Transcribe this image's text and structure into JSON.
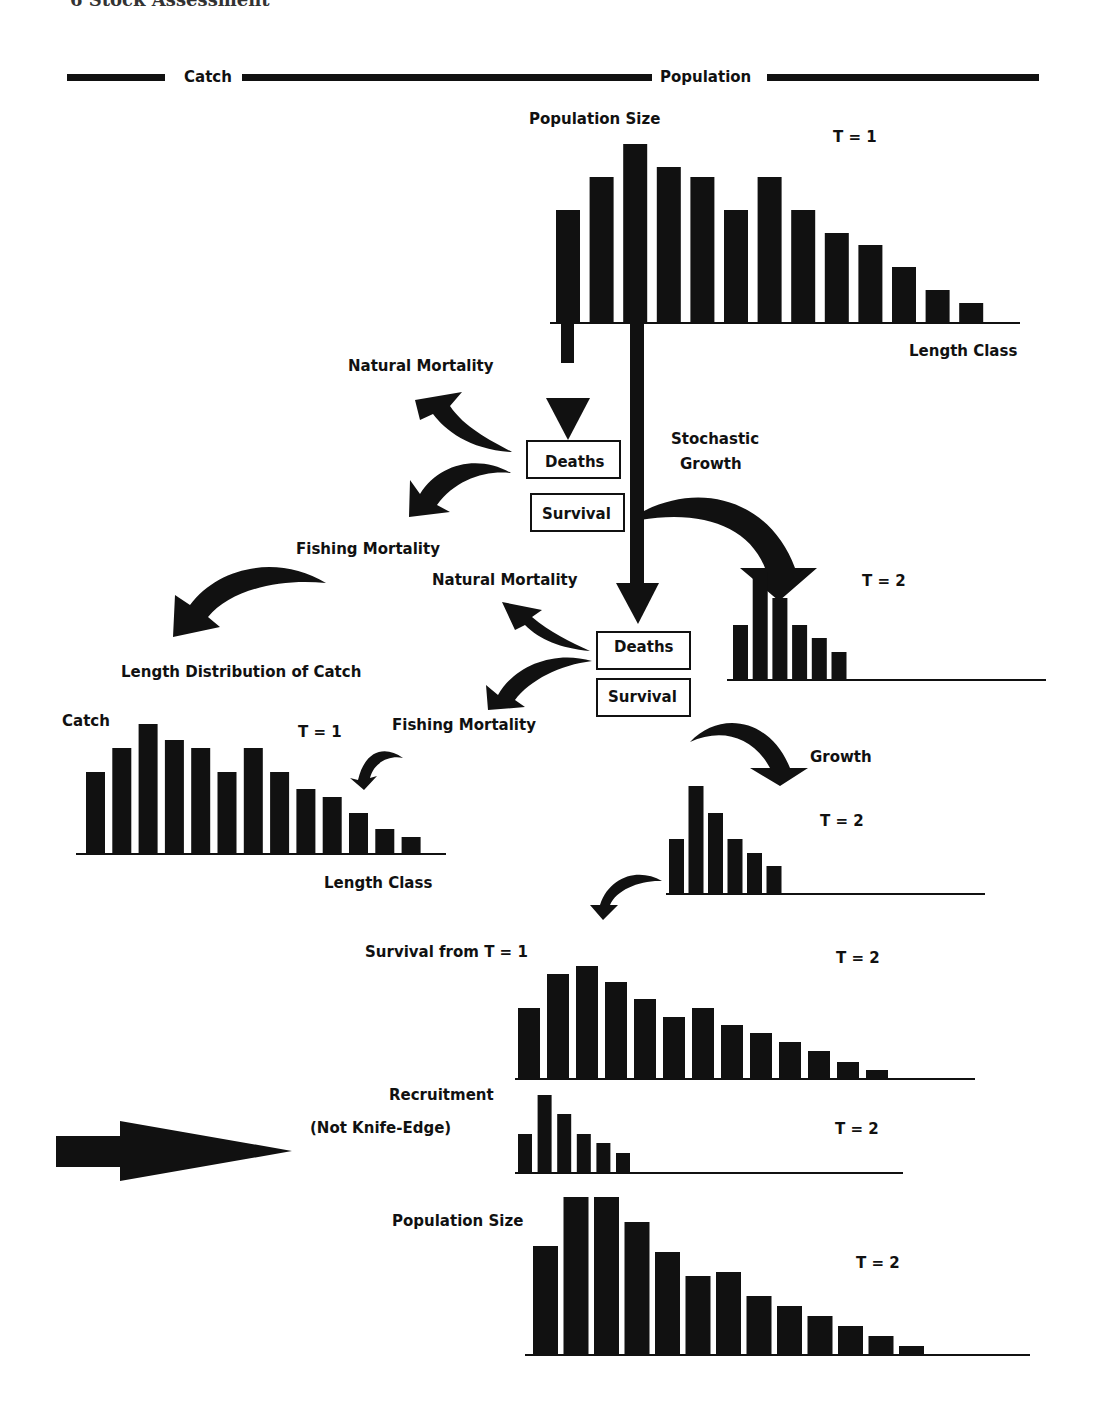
{
  "page": {
    "header_text": "6  Stock Assessment",
    "ink_color": "#111111",
    "background": "#ffffff"
  },
  "section_bar": {
    "catch_label": "Catch",
    "population_label": "Population"
  },
  "labels": {
    "population_size_t1": "Population Size",
    "t1_top": "T = 1",
    "length_class_top": "Length Class",
    "natural_mortality_1": "Natural Mortality",
    "deaths_1": "Deaths",
    "survival_1": "Survival",
    "stochastic_growth_line1": "Stochastic",
    "stochastic_growth_line2": "Growth",
    "fishing_mortality_1": "Fishing Mortality",
    "natural_mortality_2": "Natural Mortality",
    "t2_growth1": "T = 2",
    "deaths_2": "Deaths",
    "survival_2": "Survival",
    "length_distribution_catch": "Length Distribution of Catch",
    "catch": "Catch",
    "t1_catch": "T = 1",
    "fishing_mortality_2": "Fishing Mortality",
    "length_class_catch": "Length Class",
    "growth": "Growth",
    "t2_growth2": "T = 2",
    "survival_from_t1": "Survival from T = 1",
    "t2_survival": "T = 2",
    "recruitment_line1": "Recruitment",
    "recruitment_line2": "(Not Knife-Edge)",
    "t2_recruitment": "T = 2",
    "population_size_t2": "Population Size",
    "t2_population": "T = 2"
  },
  "icons": {
    "down-arrow": "straight-down-arrow",
    "curved-arrow": "curved-arrow",
    "right-arrow": "large-right-arrow"
  },
  "chart_data": [
    {
      "type": "bar",
      "title": "Population Size T = 1",
      "xlabel": "Length Class",
      "ylabel": "Population Size",
      "categories": [
        1,
        2,
        3,
        4,
        5,
        6,
        7,
        8,
        9,
        10,
        11,
        12,
        13
      ],
      "values": [
        112,
        145,
        178,
        155,
        145,
        112,
        145,
        112,
        89,
        77,
        55,
        32,
        19
      ]
    },
    {
      "type": "bar",
      "title": "Stochastic Growth T = 2 (survivors of first classes)",
      "categories": [
        1,
        2,
        3,
        4,
        5,
        6
      ],
      "values": [
        54,
        107,
        81,
        54,
        41,
        27
      ],
      "axis_extent_classes": 13
    },
    {
      "type": "bar",
      "title": "Length Distribution of Catch T = 1",
      "xlabel": "Length Class",
      "ylabel": "Catch",
      "categories": [
        1,
        2,
        3,
        4,
        5,
        6,
        7,
        8,
        9,
        10,
        11,
        12,
        13
      ],
      "values": [
        81,
        105,
        129,
        113,
        105,
        81,
        105,
        81,
        64,
        56,
        40,
        24,
        16
      ]
    },
    {
      "type": "bar",
      "title": "Growth T = 2",
      "categories": [
        1,
        2,
        3,
        4,
        5,
        6
      ],
      "values": [
        54,
        107,
        80,
        54,
        40,
        27
      ],
      "axis_extent_classes": 13
    },
    {
      "type": "bar",
      "title": "Survival from T = 1, T = 2",
      "categories": [
        1,
        2,
        3,
        4,
        5,
        6,
        7,
        8,
        9,
        10,
        11,
        12,
        13
      ],
      "values": [
        70,
        104,
        112,
        96,
        79,
        61,
        70,
        53,
        45,
        36,
        27,
        16,
        8
      ]
    },
    {
      "type": "bar",
      "title": "Recruitment (Not Knife-Edge) T = 2",
      "categories": [
        1,
        2,
        3,
        4,
        5,
        6
      ],
      "values": [
        38,
        77,
        58,
        38,
        29,
        19
      ],
      "axis_extent_classes": 13
    },
    {
      "type": "bar",
      "title": "Population Size T = 2",
      "ylabel": "Population Size",
      "categories": [
        1,
        2,
        3,
        4,
        5,
        6,
        7,
        8,
        9,
        10,
        11,
        12,
        13
      ],
      "values": [
        108,
        157,
        157,
        132,
        102,
        78,
        82,
        58,
        48,
        38,
        28,
        18,
        8
      ]
    }
  ]
}
